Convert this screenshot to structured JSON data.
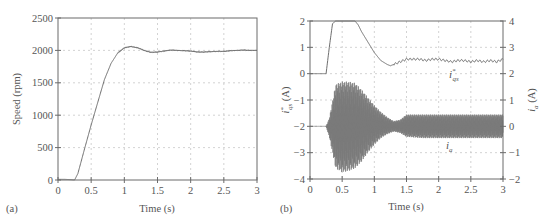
{
  "panels": {
    "a": {
      "label": "(a)",
      "xlabel": "Time (s)",
      "ylabel": "Speed (rpm)",
      "xticks": [
        "0",
        "0.5",
        "1",
        "1.5",
        "2",
        "2.5",
        "3"
      ],
      "yticks": [
        "0",
        "500",
        "1000",
        "1500",
        "2000",
        "2500"
      ]
    },
    "b": {
      "label": "(b)",
      "xlabel": "Time (s)",
      "ylabel_left": "i*qs (A)",
      "ylabel_right": "ia (A)",
      "xticks": [
        "0",
        "0.5",
        "1",
        "1.5",
        "2",
        "2.5",
        "3"
      ],
      "yticks_left": [
        "−4",
        "−3",
        "−2",
        "−1",
        "0",
        "1",
        "2"
      ],
      "yticks_right": [
        "−2",
        "−1",
        "0",
        "1",
        "2",
        "3",
        "4"
      ],
      "curve_label_iqs": "i",
      "curve_label_iqs_sub": "qs",
      "curve_label_iqs_sup": "*",
      "curve_label_ia": "i",
      "curve_label_ia_sub": "a"
    }
  },
  "chart_data": [
    {
      "type": "line",
      "title": "",
      "panel": "(a)",
      "xlabel": "Time (s)",
      "ylabel": "Speed (rpm)",
      "xlim": [
        0,
        3
      ],
      "ylim": [
        0,
        2500
      ],
      "grid": true,
      "xticks": [
        0,
        0.5,
        1,
        1.5,
        2,
        2.5,
        3
      ],
      "yticks": [
        0,
        500,
        1000,
        1500,
        2000,
        2500
      ],
      "series": [
        {
          "name": "Speed",
          "x": [
            0,
            0.1,
            0.2,
            0.25,
            0.3,
            0.4,
            0.5,
            0.6,
            0.7,
            0.8,
            0.9,
            1.0,
            1.1,
            1.2,
            1.3,
            1.4,
            1.5,
            1.6,
            1.7,
            1.8,
            1.9,
            2.0,
            2.1,
            2.2,
            2.3,
            2.4,
            2.5,
            2.6,
            2.7,
            2.8,
            2.9,
            3.0
          ],
          "y": [
            10,
            10,
            5,
            0,
            100,
            480,
            850,
            1200,
            1550,
            1800,
            1960,
            2040,
            2060,
            2040,
            2000,
            1970,
            1975,
            1990,
            2005,
            2000,
            1995,
            1990,
            1975,
            1975,
            1980,
            1985,
            1985,
            1995,
            2000,
            2005,
            2000,
            2000
          ]
        }
      ]
    },
    {
      "type": "line",
      "title": "",
      "panel": "(b)",
      "xlabel": "Time (s)",
      "ylabel": "i*qs (A)",
      "ylabel_right": "ia (A)",
      "xlim": [
        0,
        3
      ],
      "ylim": [
        -4,
        2
      ],
      "ylim_right": [
        -2,
        4
      ],
      "grid": true,
      "xticks": [
        0,
        0.5,
        1,
        1.5,
        2,
        2.5,
        3
      ],
      "yticks": [
        -4,
        -3,
        -2,
        -1,
        0,
        1,
        2
      ],
      "yticks_right": [
        -2,
        -1,
        0,
        1,
        2,
        3,
        4
      ],
      "series": [
        {
          "name": "i*qs",
          "axis": "left",
          "x": [
            0,
            0.25,
            0.3,
            0.35,
            0.4,
            0.5,
            0.6,
            0.7,
            0.75,
            0.8,
            0.9,
            1.0,
            1.1,
            1.2,
            1.25,
            1.3,
            1.4,
            1.5,
            1.6,
            1.7,
            1.8,
            1.9,
            2.0,
            2.1,
            2.2,
            2.3,
            2.4,
            2.5,
            2.6,
            2.7,
            2.8,
            2.9,
            3.0
          ],
          "y": [
            0,
            0,
            1.0,
            1.9,
            2.0,
            2.0,
            2.0,
            2.0,
            1.85,
            1.6,
            1.2,
            0.8,
            0.5,
            0.35,
            0.3,
            0.35,
            0.45,
            0.55,
            0.55,
            0.55,
            0.5,
            0.55,
            0.55,
            0.5,
            0.45,
            0.5,
            0.5,
            0.45,
            0.5,
            0.45,
            0.5,
            0.45,
            0.55
          ]
        },
        {
          "name": "ia",
          "axis": "right",
          "description": "oscillating phase current envelope",
          "x": [
            0,
            0.25,
            0.3,
            0.4,
            0.5,
            0.6,
            0.7,
            0.8,
            0.9,
            1.0,
            1.1,
            1.2,
            1.3,
            1.4,
            1.5,
            1.75,
            2.0,
            2.25,
            2.5,
            2.75,
            3.0
          ],
          "envelope_max": [
            0,
            0,
            0.3,
            1.6,
            1.7,
            1.7,
            1.65,
            1.4,
            1.1,
            0.8,
            0.55,
            0.35,
            0.2,
            0.25,
            0.45,
            0.45,
            0.45,
            0.45,
            0.45,
            0.45,
            0.45
          ],
          "envelope_min": [
            0,
            0,
            -0.4,
            -1.6,
            -1.75,
            -1.7,
            -1.6,
            -1.35,
            -1.0,
            -0.7,
            -0.45,
            -0.3,
            -0.2,
            -0.25,
            -0.4,
            -0.45,
            -0.45,
            -0.45,
            -0.45,
            -0.45,
            -0.45
          ]
        }
      ]
    }
  ]
}
